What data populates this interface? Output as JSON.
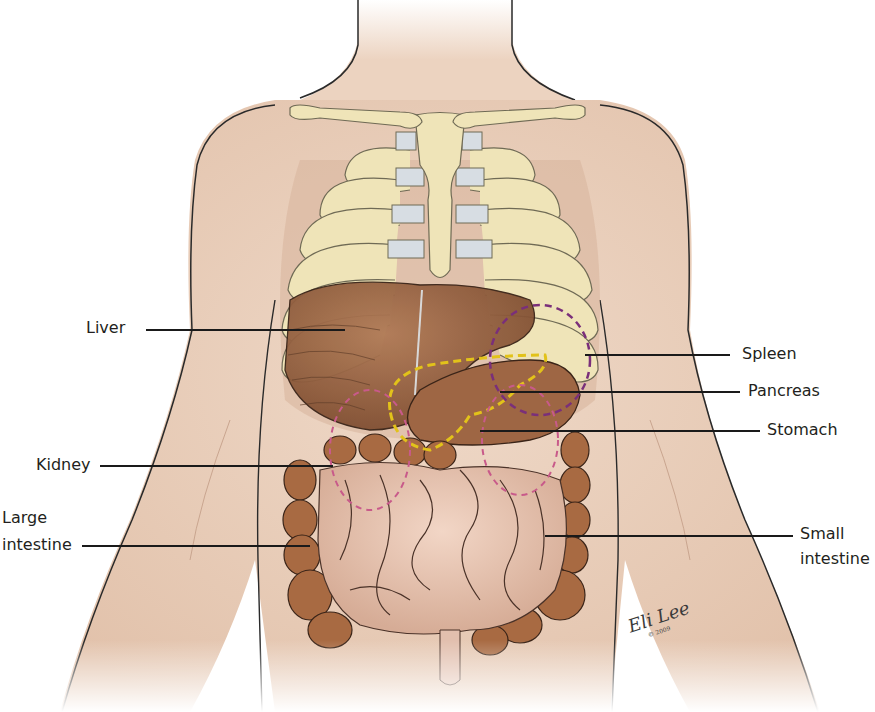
{
  "figure": {
    "colors": {
      "background": "#ffffff",
      "skin": "#ecd3c0",
      "skin_shadow": "#d9b7a0",
      "bone": "#efe4b8",
      "cartilage": "#d7dde3",
      "liver": "#8c5a3c",
      "stomach": "#9e6644",
      "large_intestine": "#a86a42",
      "small_intestine": "#e8c4b0",
      "pancreas_outline": "#e2c21a",
      "spleen_outline": "#7a2f7a",
      "kidney_outline": "#c85a8a",
      "leader_line": "#1a1a1a",
      "label_text": "#231f20"
    }
  },
  "labels": {
    "liver": "Liver",
    "kidney": "Kidney",
    "large_intestine_1": "Large",
    "large_intestine_2": "intestine",
    "spleen": "Spleen",
    "pancreas": "Pancreas",
    "stomach": "Stomach",
    "small_intestine_1": "Small",
    "small_intestine_2": "intestine"
  },
  "signature": {
    "text": "Eli Lee",
    "copyright": "© 2009"
  }
}
